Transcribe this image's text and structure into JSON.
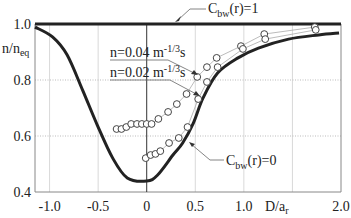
{
  "chart_data": {
    "type": "line",
    "title": "",
    "xlabel": "D/a_r",
    "ylabel": "n/n_eq",
    "xlim": [
      -1.15,
      2.0
    ],
    "ylim": [
      0.4,
      1.0
    ],
    "x_ticks": [
      -1.0,
      -0.5,
      0,
      0.5,
      1.0,
      2.0
    ],
    "x_tick_labels": [
      "-1.0",
      "-0.5",
      "0",
      "0.5",
      "1.0",
      "2.0"
    ],
    "y_ticks": [
      0.4,
      0.6,
      0.8,
      1.0
    ],
    "y_tick_labels": [
      "0.4",
      "0.6",
      "0.8",
      "1.0"
    ],
    "grid": true,
    "series": [
      {
        "name": "C_bw(r)=1",
        "style": "thick-line",
        "x": [
          -1.15,
          2.0
        ],
        "y": [
          1.0,
          1.0
        ]
      },
      {
        "name": "C_bw(r)=0",
        "style": "thick-line",
        "x": [
          -1.15,
          -0.97,
          -0.82,
          -0.66,
          -0.51,
          -0.35,
          -0.2,
          0.0,
          0.11,
          0.27,
          0.37,
          0.48,
          0.58,
          0.73,
          0.94,
          1.15,
          1.46,
          1.77,
          1.98
        ],
        "y": [
          0.989,
          0.954,
          0.89,
          0.764,
          0.64,
          0.521,
          0.45,
          0.439,
          0.46,
          0.532,
          0.575,
          0.646,
          0.736,
          0.825,
          0.879,
          0.914,
          0.946,
          0.961,
          0.968
        ]
      },
      {
        "name": "n=0.04 m^-1/3 s",
        "style": "circles-thin-line",
        "x": [
          -0.31,
          -0.26,
          -0.21,
          -0.16,
          -0.1,
          -0.05,
          0.0,
          0.05,
          0.12,
          0.22,
          0.31,
          0.41,
          0.52,
          0.62,
          0.72,
          0.97,
          1.21,
          1.73
        ],
        "y": [
          0.625,
          0.625,
          0.632,
          0.643,
          0.643,
          0.643,
          0.643,
          0.643,
          0.661,
          0.686,
          0.714,
          0.75,
          0.811,
          0.846,
          0.879,
          0.921,
          0.964,
          0.989
        ]
      },
      {
        "name": "n=0.02 m^-1/3 s",
        "style": "circles-thin-line",
        "x": [
          -0.01,
          0.04,
          0.09,
          0.14,
          0.23,
          0.33,
          0.42,
          0.53,
          0.62,
          0.73,
          0.99,
          1.22,
          1.74
        ],
        "y": [
          0.521,
          0.532,
          0.536,
          0.546,
          0.575,
          0.593,
          0.632,
          0.732,
          0.793,
          0.846,
          0.911,
          0.946,
          0.979
        ]
      }
    ],
    "annotations": [
      {
        "text_main": "C",
        "text_sub": "bw",
        "text_rest": "(r)=1",
        "points_to": "C_bw(r)=1",
        "position": "top"
      },
      {
        "text_main": "n=0.04 m",
        "text_sup": "-1/3",
        "text_rest": "s",
        "points_to": "n=0.04 m^-1/3 s",
        "position": "upper-middle"
      },
      {
        "text_main": "n=0.02 m",
        "text_sup": "-1/3",
        "text_rest": "s",
        "points_to": "n=0.02 m^-1/3 s",
        "position": "upper-middle"
      },
      {
        "text_main": "C",
        "text_sub": "bw",
        "text_rest": "(r)=0",
        "points_to": "C_bw(r)=0",
        "position": "lower-right"
      }
    ]
  }
}
